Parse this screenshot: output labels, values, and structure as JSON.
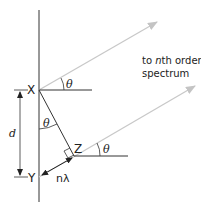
{
  "diagram": {
    "labels": {
      "point_x": "X",
      "point_y": "Y",
      "point_z": "Z",
      "spacing": "d",
      "angle": "θ",
      "path_difference": "nλ",
      "caption_line1": "to nth order",
      "caption_line1_pre": "to ",
      "caption_line1_n": "n",
      "caption_line1_post": "th order",
      "caption_line2": "spectrum"
    },
    "colors": {
      "line": "#333333",
      "ray": "#c8c8c8",
      "text": "#222222"
    }
  }
}
